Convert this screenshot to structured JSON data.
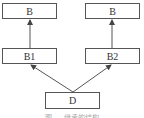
{
  "diagram": {
    "type": "inheritance-graph",
    "nodes": [
      {
        "id": "b_left",
        "label": "B"
      },
      {
        "id": "b_right",
        "label": "B"
      },
      {
        "id": "b1",
        "label": "B1"
      },
      {
        "id": "b2",
        "label": "B2"
      },
      {
        "id": "d",
        "label": "D"
      }
    ],
    "edges": [
      {
        "from": "b1",
        "to": "b_left"
      },
      {
        "from": "b2",
        "to": "b_right"
      },
      {
        "from": "d",
        "to": "b1"
      },
      {
        "from": "d",
        "to": "b2"
      }
    ],
    "colors": {
      "stroke": "#555555",
      "text": "#333333",
      "background": "#ffffff"
    },
    "caption": "图 … 继承的结构"
  }
}
